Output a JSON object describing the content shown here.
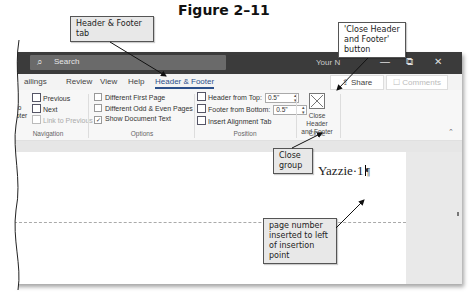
{
  "figure_title": "Figure 2–11",
  "window": {
    "search_label": "Search",
    "search_icon": "search-icon",
    "doc_name": "Your N",
    "controls": {
      "minimize": "—",
      "restore": "⧉",
      "close": "✕"
    }
  },
  "tabs": [
    {
      "label": "ailings",
      "active": false
    },
    {
      "label": "Review",
      "active": false
    },
    {
      "label": "View",
      "active": false
    },
    {
      "label": "Help",
      "active": false
    },
    {
      "label": "Header & Footer",
      "active": true
    }
  ],
  "share_label": "Share",
  "comments_label": "Comments",
  "ribbon": {
    "navigation": {
      "partial_button": [
        "to",
        "oter"
      ],
      "previous": "Previous",
      "next": "Next",
      "link_to_previous": "Link to Previous",
      "group_label": "Navigation"
    },
    "options": {
      "different_first_page": {
        "label": "Different First Page",
        "checked": false
      },
      "different_odd_even": {
        "label": "Different Odd & Even Pages",
        "checked": false
      },
      "show_document_text": {
        "label": "Show Document Text",
        "checked": true
      },
      "group_label": "Options"
    },
    "position": {
      "header_from_top_label": "Header from Top:",
      "header_from_top_value": "0.5\"",
      "footer_from_bottom_label": "Footer from Bottom:",
      "footer_from_bottom_value": "0.5\"",
      "insert_alignment_tab": "Insert Alignment Tab",
      "group_label": "Position"
    },
    "close": {
      "button_line1": "Close Header",
      "button_line2": "and Footer",
      "group_label": "Close"
    }
  },
  "document": {
    "header_text": "Yazzie·1",
    "paragraph_mark": "¶"
  },
  "callouts": {
    "header_footer_tab": [
      "Header & Footer",
      "tab"
    ],
    "close_button": [
      "'Close Header",
      "and Footer'",
      "button"
    ],
    "close_group": [
      "Close",
      "group"
    ],
    "page_number": [
      "page number",
      "inserted to left",
      "of insertion point"
    ]
  }
}
